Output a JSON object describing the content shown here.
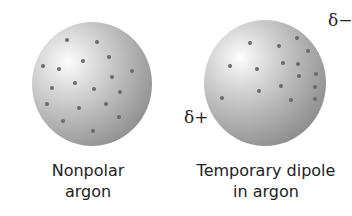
{
  "figure": {
    "left": {
      "label_line1": "Nonpolar",
      "label_line2": "argon",
      "dots": [
        [
          67,
          40
        ],
        [
          97,
          42
        ],
        [
          43,
          66
        ],
        [
          59,
          69
        ],
        [
          83,
          61
        ],
        [
          109,
          57
        ],
        [
          132,
          71
        ],
        [
          112,
          77
        ],
        [
          52,
          88
        ],
        [
          75,
          83
        ],
        [
          94,
          89
        ],
        [
          47,
          104
        ],
        [
          79,
          108
        ],
        [
          106,
          104
        ],
        [
          119,
          117
        ],
        [
          63,
          121
        ],
        [
          93,
          131
        ],
        [
          120,
          92
        ]
      ]
    },
    "right": {
      "label_line1": "Temporary dipole",
      "label_line2": "in argon",
      "delta_plus": "δ+",
      "delta_minus": "δ−",
      "dots": [
        [
          250,
          43
        ],
        [
          279,
          46
        ],
        [
          297,
          38
        ],
        [
          308,
          51
        ],
        [
          230,
          66
        ],
        [
          257,
          69
        ],
        [
          283,
          63
        ],
        [
          298,
          64
        ],
        [
          299,
          76
        ],
        [
          316,
          74
        ],
        [
          281,
          86
        ],
        [
          259,
          91
        ],
        [
          315,
          87
        ],
        [
          291,
          100
        ],
        [
          315,
          99
        ],
        [
          222,
          98
        ]
      ]
    }
  }
}
